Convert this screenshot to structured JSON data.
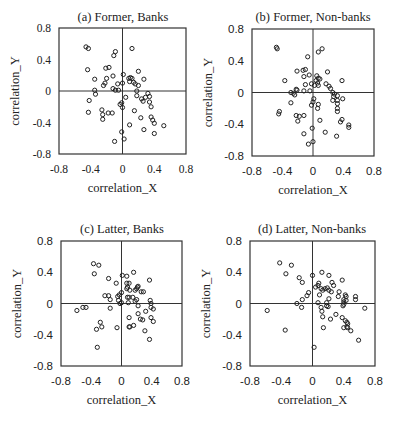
{
  "figure": {
    "panels": [
      {
        "id": "a",
        "title": "(a) Former, Banks",
        "xlabel": "correlation_X",
        "ylabel": "correlation_Y",
        "tick_font": "serif"
      },
      {
        "id": "b",
        "title": "(b) Former, Non-banks",
        "xlabel": "correlation_X",
        "ylabel": "correlation_Y",
        "tick_font": "sans"
      },
      {
        "id": "c",
        "title": "(c) Latter, Banks",
        "xlabel": "correlation_X",
        "ylabel": "correlation_Y",
        "tick_font": "sans"
      },
      {
        "id": "d",
        "title": "(d) Latter, Non-banks",
        "xlabel": "correlation_X",
        "ylabel": "correlation_Y",
        "tick_font": "sans"
      }
    ],
    "xticks": [
      "-0.8",
      "-0.4",
      "0",
      "0.4",
      "0.8"
    ],
    "yticks": [
      "0.8",
      "0.4",
      "0",
      "-0.4",
      "-0.8"
    ]
  },
  "chart_data": [
    {
      "type": "scatter",
      "title": "(a) Former, Banks",
      "xlabel": "correlation_X",
      "ylabel": "correlation_Y",
      "xlim": [
        -0.8,
        0.8
      ],
      "ylim": [
        -0.8,
        0.8
      ],
      "xticks": [
        -0.8,
        -0.4,
        0,
        0.4,
        0.8
      ],
      "yticks": [
        -0.8,
        -0.4,
        0,
        0.4,
        0.8
      ],
      "grid": false,
      "zero_lines": true,
      "points": [
        [
          -0.46,
          0.56
        ],
        [
          -0.43,
          0.54
        ],
        [
          -0.09,
          0.5
        ],
        [
          -0.11,
          0.45
        ],
        [
          0.12,
          0.54
        ],
        [
          -0.44,
          0.27
        ],
        [
          -0.21,
          0.29
        ],
        [
          -0.17,
          0.3
        ],
        [
          -0.12,
          0.19
        ],
        [
          -0.35,
          0.15
        ],
        [
          -0.2,
          0.16
        ],
        [
          0.01,
          0.21
        ],
        [
          0.2,
          0.25
        ],
        [
          0.27,
          0.15
        ],
        [
          -0.24,
          0.07
        ],
        [
          -0.22,
          0.1
        ],
        [
          -0.06,
          0.09
        ],
        [
          0.0,
          0.1
        ],
        [
          0.08,
          0.16
        ],
        [
          0.1,
          0.17
        ],
        [
          0.12,
          0.16
        ],
        [
          0.09,
          0.12
        ],
        [
          0.14,
          0.11
        ],
        [
          0.16,
          0.09
        ],
        [
          0.2,
          0.07
        ],
        [
          -0.35,
          0.01
        ],
        [
          -0.34,
          -0.04
        ],
        [
          -0.12,
          0.03
        ],
        [
          -0.09,
          0.01
        ],
        [
          -0.05,
          0.01
        ],
        [
          0.18,
          0.0
        ],
        [
          -0.42,
          -0.12
        ],
        [
          -0.03,
          -0.17
        ],
        [
          -0.01,
          -0.15
        ],
        [
          0.0,
          -0.21
        ],
        [
          0.04,
          -0.08
        ],
        [
          0.18,
          -0.06
        ],
        [
          0.24,
          -0.1
        ],
        [
          0.26,
          -0.13
        ],
        [
          0.29,
          -0.08
        ],
        [
          0.32,
          -0.03
        ],
        [
          0.34,
          -0.07
        ],
        [
          0.34,
          -0.14
        ],
        [
          0.36,
          -0.2
        ],
        [
          -0.43,
          -0.27
        ],
        [
          -0.26,
          -0.24
        ],
        [
          -0.25,
          -0.3
        ],
        [
          -0.18,
          -0.28
        ],
        [
          -0.13,
          -0.28
        ],
        [
          0.15,
          -0.25
        ],
        [
          -0.25,
          -0.36
        ],
        [
          0.23,
          -0.34
        ],
        [
          0.36,
          -0.33
        ],
        [
          0.38,
          -0.37
        ],
        [
          0.4,
          -0.41
        ],
        [
          0.52,
          -0.44
        ],
        [
          0.09,
          -0.43
        ],
        [
          0.27,
          -0.49
        ],
        [
          0.4,
          -0.54
        ],
        [
          -0.01,
          -0.52
        ],
        [
          0.02,
          -0.61
        ],
        [
          -0.1,
          -0.64
        ]
      ]
    },
    {
      "type": "scatter",
      "title": "(b) Former, Non-banks",
      "xlabel": "correlation_X",
      "ylabel": "correlation_Y",
      "xlim": [
        -0.8,
        0.8
      ],
      "ylim": [
        -0.8,
        0.8
      ],
      "xticks": [
        -0.8,
        -0.4,
        0,
        0.4,
        0.8
      ],
      "yticks": [
        -0.8,
        -0.4,
        0,
        -0.4,
        0.8
      ],
      "grid": false,
      "zero_lines": true,
      "points": [
        [
          -0.48,
          0.57
        ],
        [
          -0.47,
          0.55
        ],
        [
          0.12,
          0.55
        ],
        [
          0.07,
          0.51
        ],
        [
          -0.07,
          0.45
        ],
        [
          -0.21,
          0.27
        ],
        [
          -0.13,
          0.28
        ],
        [
          -0.1,
          0.29
        ],
        [
          0.19,
          0.26
        ],
        [
          -0.37,
          0.15
        ],
        [
          -0.12,
          0.2
        ],
        [
          -0.05,
          0.22
        ],
        [
          0.05,
          0.21
        ],
        [
          0.09,
          0.17
        ],
        [
          0.04,
          0.15
        ],
        [
          0.07,
          0.18
        ],
        [
          0.38,
          0.15
        ],
        [
          -0.1,
          0.1
        ],
        [
          -0.02,
          0.11
        ],
        [
          0.02,
          0.09
        ],
        [
          0.06,
          0.12
        ],
        [
          0.07,
          0.09
        ],
        [
          0.17,
          0.11
        ],
        [
          0.21,
          0.08
        ],
        [
          0.23,
          0.05
        ],
        [
          -0.22,
          0.04
        ],
        [
          -0.21,
          0.03
        ],
        [
          -0.29,
          0.0
        ],
        [
          -0.26,
          -0.01
        ],
        [
          -0.12,
          0.02
        ],
        [
          -0.04,
          0.02
        ],
        [
          0.26,
          0.0
        ],
        [
          0.28,
          -0.02
        ],
        [
          -0.24,
          -0.03
        ],
        [
          0.01,
          -0.08
        ],
        [
          0.0,
          -0.12
        ],
        [
          -0.02,
          -0.16
        ],
        [
          0.27,
          -0.05
        ],
        [
          0.32,
          -0.04
        ],
        [
          0.39,
          -0.08
        ],
        [
          0.26,
          -0.1
        ],
        [
          0.32,
          -0.1
        ],
        [
          0.07,
          -0.15
        ],
        [
          0.06,
          -0.2
        ],
        [
          0.32,
          -0.14
        ],
        [
          0.32,
          -0.2
        ],
        [
          0.32,
          -0.24
        ],
        [
          -0.29,
          -0.13
        ],
        [
          -0.44,
          -0.24
        ],
        [
          -0.45,
          -0.27
        ],
        [
          -0.22,
          -0.29
        ],
        [
          -0.18,
          -0.3
        ],
        [
          -0.12,
          -0.29
        ],
        [
          -0.2,
          -0.36
        ],
        [
          0.09,
          -0.35
        ],
        [
          0.38,
          -0.34
        ],
        [
          0.36,
          -0.37
        ],
        [
          0.47,
          -0.41
        ],
        [
          0.47,
          -0.44
        ],
        [
          -0.01,
          -0.45
        ],
        [
          -0.12,
          -0.52
        ],
        [
          0.16,
          -0.5
        ],
        [
          0.31,
          -0.55
        ],
        [
          0.0,
          -0.62
        ],
        [
          -0.06,
          -0.65
        ]
      ]
    },
    {
      "type": "scatter",
      "title": "(c) Latter, Banks",
      "xlabel": "correlation_X",
      "ylabel": "correlation_Y",
      "xlim": [
        -0.8,
        0.8
      ],
      "ylim": [
        -0.8,
        0.8
      ],
      "xticks": [
        -0.8,
        -0.4,
        0,
        0.4,
        0.8
      ],
      "yticks": [
        -0.8,
        -0.4,
        0,
        0.4,
        0.8
      ],
      "grid": false,
      "zero_lines": true,
      "points": [
        [
          -0.37,
          0.51
        ],
        [
          -0.3,
          0.49
        ],
        [
          -0.36,
          0.38
        ],
        [
          0.16,
          0.4
        ],
        [
          0.01,
          0.36
        ],
        [
          0.07,
          0.35
        ],
        [
          -0.17,
          0.32
        ],
        [
          0.37,
          0.3
        ],
        [
          -0.07,
          0.26
        ],
        [
          0.07,
          0.26
        ],
        [
          0.1,
          0.26
        ],
        [
          0.08,
          0.21
        ],
        [
          0.07,
          0.19
        ],
        [
          0.21,
          0.21
        ],
        [
          0.22,
          0.22
        ],
        [
          0.18,
          0.17
        ],
        [
          0.2,
          0.19
        ],
        [
          0.26,
          0.15
        ],
        [
          0.29,
          0.15
        ],
        [
          0.11,
          0.17
        ],
        [
          -0.22,
          0.1
        ],
        [
          -0.17,
          0.1
        ],
        [
          -0.05,
          0.09
        ],
        [
          -0.03,
          0.11
        ],
        [
          0.0,
          0.14
        ],
        [
          0.08,
          0.08
        ],
        [
          0.1,
          0.08
        ],
        [
          0.15,
          0.08
        ],
        [
          -0.15,
          0.05
        ],
        [
          -0.04,
          0.04
        ],
        [
          -0.02,
          0.0
        ],
        [
          0.0,
          0.01
        ],
        [
          0.09,
          0.01
        ],
        [
          0.18,
          0.03
        ],
        [
          0.2,
          0.05
        ],
        [
          0.38,
          0.04
        ],
        [
          0.39,
          0.0
        ],
        [
          -0.59,
          -0.09
        ],
        [
          -0.51,
          -0.05
        ],
        [
          -0.47,
          -0.05
        ],
        [
          -0.15,
          -0.06
        ],
        [
          0.22,
          -0.03
        ],
        [
          0.39,
          -0.05
        ],
        [
          0.42,
          -0.07
        ],
        [
          0.32,
          -0.1
        ],
        [
          0.1,
          -0.18
        ],
        [
          0.22,
          -0.13
        ],
        [
          0.25,
          -0.2
        ],
        [
          0.28,
          -0.21
        ],
        [
          0.39,
          -0.18
        ],
        [
          0.42,
          -0.23
        ],
        [
          0.16,
          -0.28
        ],
        [
          -0.28,
          -0.24
        ],
        [
          -0.33,
          -0.33
        ],
        [
          -0.26,
          -0.3
        ],
        [
          -0.06,
          -0.31
        ],
        [
          0.1,
          -0.3
        ],
        [
          0.11,
          -0.3
        ],
        [
          0.31,
          -0.35
        ],
        [
          0.37,
          -0.46
        ],
        [
          -0.32,
          -0.56
        ]
      ]
    },
    {
      "type": "scatter",
      "title": "(d) Latter, Non-banks",
      "xlabel": "correlation_X",
      "ylabel": "correlation_Y",
      "xlim": [
        -0.8,
        0.8
      ],
      "ylim": [
        -0.8,
        0.8
      ],
      "xticks": [
        -0.8,
        -0.4,
        0,
        0.4,
        0.8
      ],
      "yticks": [
        -0.8,
        -0.4,
        0,
        0.4,
        0.8
      ],
      "grid": false,
      "zero_lines": true,
      "points": [
        [
          -0.42,
          0.52
        ],
        [
          -0.27,
          0.49
        ],
        [
          -0.34,
          0.38
        ],
        [
          0.12,
          0.4
        ],
        [
          0.0,
          0.36
        ],
        [
          0.21,
          0.36
        ],
        [
          -0.17,
          0.33
        ],
        [
          -0.13,
          0.27
        ],
        [
          0.38,
          0.3
        ],
        [
          0.08,
          0.26
        ],
        [
          0.25,
          0.27
        ],
        [
          0.07,
          0.23
        ],
        [
          0.04,
          0.21
        ],
        [
          0.11,
          0.19
        ],
        [
          0.16,
          0.19
        ],
        [
          0.19,
          0.2
        ],
        [
          0.21,
          0.17
        ],
        [
          0.24,
          0.15
        ],
        [
          0.27,
          0.23
        ],
        [
          0.13,
          0.17
        ],
        [
          -0.05,
          0.14
        ],
        [
          -0.07,
          0.1
        ],
        [
          0.09,
          0.11
        ],
        [
          0.21,
          0.06
        ],
        [
          0.34,
          0.15
        ],
        [
          0.33,
          0.09
        ],
        [
          0.42,
          0.11
        ],
        [
          0.43,
          0.09
        ],
        [
          0.55,
          0.09
        ],
        [
          0.55,
          0.05
        ],
        [
          -0.13,
          0.05
        ],
        [
          -0.2,
          0.0
        ],
        [
          0.07,
          0.01
        ],
        [
          0.18,
          0.01
        ],
        [
          0.4,
          0.05
        ],
        [
          0.4,
          0.02
        ],
        [
          0.4,
          -0.01
        ],
        [
          0.39,
          -0.03
        ],
        [
          0.43,
          0.04
        ],
        [
          -0.58,
          -0.09
        ],
        [
          -0.14,
          -0.05
        ],
        [
          0.11,
          -0.05
        ],
        [
          0.12,
          -0.1
        ],
        [
          0.18,
          -0.03
        ],
        [
          0.2,
          -0.04
        ],
        [
          0.67,
          -0.06
        ],
        [
          0.13,
          -0.17
        ],
        [
          0.23,
          -0.2
        ],
        [
          0.3,
          -0.14
        ],
        [
          0.38,
          -0.18
        ],
        [
          0.42,
          -0.22
        ],
        [
          0.44,
          -0.24
        ],
        [
          0.45,
          -0.26
        ],
        [
          0.44,
          -0.3
        ],
        [
          0.45,
          -0.31
        ],
        [
          0.4,
          -0.31
        ],
        [
          0.49,
          -0.35
        ],
        [
          -0.35,
          -0.34
        ],
        [
          0.14,
          -0.31
        ],
        [
          0.59,
          -0.47
        ],
        [
          0.02,
          -0.56
        ]
      ]
    }
  ]
}
